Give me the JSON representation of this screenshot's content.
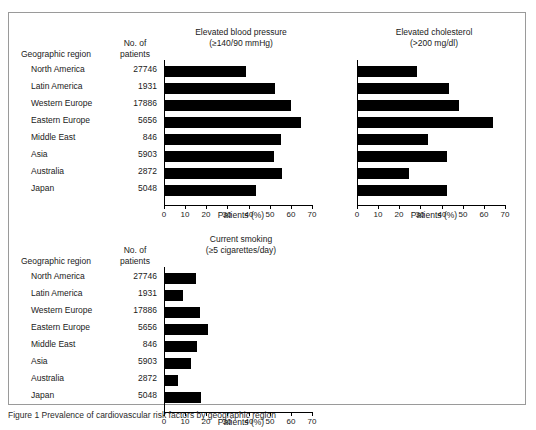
{
  "figure": {
    "caption": "Figure 1 Prevalence of cardiovascular risk factors by geographic region"
  },
  "table_headers": {
    "region": "Geographic region",
    "patients_line1": "No. of",
    "patients_line2": "patients"
  },
  "regions": [
    {
      "label": "North America",
      "patients": "27746"
    },
    {
      "label": "Latin America",
      "patients": "1931"
    },
    {
      "label": "Western Europe",
      "patients": "17886"
    },
    {
      "label": "Eastern Europe",
      "patients": "5656"
    },
    {
      "label": "Middle East",
      "patients": "846"
    },
    {
      "label": "Asia",
      "patients": "5903"
    },
    {
      "label": "Australia",
      "patients": "2872"
    },
    {
      "label": "Japan",
      "patients": "5048"
    }
  ],
  "chart_data": [
    {
      "type": "bar",
      "id": "blood-pressure",
      "title": "Elevated blood pressure",
      "subtitle": "(≥140/90 mmHg)",
      "orientation": "horizontal",
      "categories": [
        "North America",
        "Latin America",
        "Western Europe",
        "Eastern Europe",
        "Middle East",
        "Asia",
        "Australia",
        "Japan"
      ],
      "values": [
        38.5,
        52.0,
        59.5,
        64.5,
        55.0,
        51.5,
        55.5,
        43.0
      ],
      "xlabel": "Patients (%)",
      "ylabel": "",
      "xlim": [
        0,
        70
      ],
      "xticks": [
        0,
        10,
        20,
        30,
        40,
        50,
        60,
        70
      ],
      "grid": false,
      "legend": "none",
      "bar_color": "#000000"
    },
    {
      "type": "bar",
      "id": "cholesterol",
      "title": "Elevated cholesterol",
      "subtitle": "(>200 mg/dl)",
      "orientation": "horizontal",
      "categories": [
        "North America",
        "Latin America",
        "Western Europe",
        "Eastern Europe",
        "Middle East",
        "Asia",
        "Australia",
        "Japan"
      ],
      "values": [
        28.0,
        43.0,
        48.0,
        64.0,
        33.0,
        42.0,
        24.0,
        42.0
      ],
      "xlabel": "Patients (%)",
      "ylabel": "",
      "xlim": [
        0,
        70
      ],
      "xticks": [
        0,
        10,
        20,
        30,
        40,
        50,
        60,
        70
      ],
      "grid": false,
      "legend": "none",
      "bar_color": "#000000"
    },
    {
      "type": "bar",
      "id": "smoking",
      "title": "Current smoking",
      "subtitle": "(≥5 cigarettes/day)",
      "orientation": "horizontal",
      "categories": [
        "North America",
        "Latin America",
        "Western Europe",
        "Eastern Europe",
        "Middle East",
        "Asia",
        "Australia",
        "Japan"
      ],
      "values": [
        14.5,
        8.5,
        16.5,
        20.5,
        15.0,
        12.5,
        6.0,
        17.0
      ],
      "xlabel": "Patients (%)",
      "ylabel": "",
      "xlim": [
        0,
        70
      ],
      "xticks": [
        0,
        10,
        20,
        30,
        40,
        50,
        60,
        70
      ],
      "grid": false,
      "legend": "none",
      "bar_color": "#000000"
    }
  ]
}
